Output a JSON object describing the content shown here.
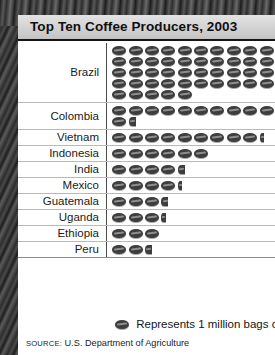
{
  "title": "Top Ten Coffee Producers, 2003",
  "legend": {
    "icon": "coffee-bean-icon",
    "text": "Represents 1 million bags of coffee"
  },
  "source": {
    "prefix": "SOURCE:",
    "text": "U.S. Department of Agriculture"
  },
  "colors": {
    "bean": "#3d3d3d",
    "title_bar": "#d2d2d2",
    "rule": "#b9b9b9",
    "page": "#ffffff"
  },
  "chart_data": {
    "type": "bar",
    "subtype": "pictograph",
    "title": "Top Ten Coffee Producers, 2003",
    "xlabel": "Millions of bags of coffee",
    "ylabel": "Country",
    "unit": "1 million bags of coffee",
    "icon_value": 1,
    "icons_per_row": 9,
    "grid": false,
    "legend_position": "bottom",
    "categories": [
      "Brazil",
      "Colombia",
      "Vietnam",
      "Indonesia",
      "India",
      "Mexico",
      "Guatemala",
      "Uganda",
      "Ethiopia",
      "Peru"
    ],
    "values": [
      45,
      11.5,
      9.5,
      6,
      4.5,
      4.5,
      4,
      3.5,
      3,
      2.5
    ],
    "rows": [
      {
        "country": "Brazil",
        "value": 45,
        "full": 45,
        "fraction": 0
      },
      {
        "country": "Colombia",
        "value": 11.5,
        "full": 11,
        "fraction": 0.5
      },
      {
        "country": "Vietnam",
        "value": 9.25,
        "full": 9,
        "fraction": 0.25
      },
      {
        "country": "Indonesia",
        "value": 6,
        "full": 6,
        "fraction": 0
      },
      {
        "country": "India",
        "value": 4.5,
        "full": 4,
        "fraction": 0.5
      },
      {
        "country": "Mexico",
        "value": 4.25,
        "full": 4,
        "fraction": 0.25
      },
      {
        "country": "Guatemala",
        "value": 4,
        "full": 3,
        "fraction": 0.5
      },
      {
        "country": "Uganda",
        "value": 3.25,
        "full": 3,
        "fraction": 0.25
      },
      {
        "country": "Ethiopia",
        "value": 3,
        "full": 3,
        "fraction": 0
      },
      {
        "country": "Peru",
        "value": 2.5,
        "full": 2,
        "fraction": 0.5
      }
    ]
  }
}
